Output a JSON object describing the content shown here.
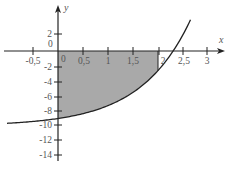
{
  "chart_data": {
    "type": "area",
    "title": "",
    "xlabel": "x",
    "ylabel": "y",
    "function_description": "Curve approx. y = e^x - 10 with horizontal asymptote y = -10; region between curve and x-axis for 0 <= x <= 2 is shaded",
    "xlim": [
      -1.05,
      3.35
    ],
    "ylim": [
      -14.8,
      6.1
    ],
    "x_ticks": [
      -0.5,
      0.5,
      1,
      1.5,
      2,
      2.5,
      3
    ],
    "x_tick_labels": [
      "-0,5",
      "0,5",
      "1",
      "1,5",
      "2",
      "2,5",
      "3"
    ],
    "y_ticks": [
      2,
      -2,
      -4,
      -6,
      -8,
      -10,
      -12,
      -14
    ],
    "y_tick_labels": [
      "2",
      "-2",
      "-4",
      "-6",
      "-8",
      "-10",
      "-12",
      "-14"
    ],
    "origin_labels": [
      "0",
      "0"
    ],
    "curve_points": {
      "x": [
        -1.0,
        -0.5,
        0,
        0.5,
        1.0,
        1.5,
        2.0,
        2.3,
        2.5,
        2.65
      ],
      "y": [
        -9.63,
        -9.39,
        -9.0,
        -8.35,
        -7.28,
        -5.52,
        -2.61,
        -0.03,
        2.18,
        4.15
      ]
    },
    "shaded_region": {
      "x_from": 0,
      "x_to": 2,
      "between": "curve and x-axis",
      "color": "#a9a9a9"
    },
    "x_intercept": 2.3,
    "y_intercept": -9,
    "grid": false,
    "legend": null,
    "colors": {
      "axis": "#222222",
      "curve": "#222222",
      "shade": "#a9a9a9",
      "labels": "#555555"
    }
  },
  "labels": {
    "x_axis_name": "x",
    "y_axis_name": "y",
    "origin_y": "0",
    "origin_x": "0",
    "x_ticks": [
      "-0,5",
      "0,5",
      "1",
      "1,5",
      "2",
      "2,5",
      "3"
    ],
    "y_ticks": [
      "2",
      "-2",
      "-4",
      "-6",
      "-8",
      "-10",
      "-12",
      "-14"
    ]
  }
}
